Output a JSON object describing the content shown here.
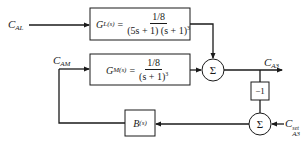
{
  "diagram": {
    "type": "block-diagram",
    "inputs": {
      "load_disturbance": {
        "symbol": "C",
        "subscript": "AL"
      },
      "setpoint": {
        "symbol": "C",
        "subscript": "A3",
        "superscript": "set"
      }
    },
    "signals": {
      "manipulated": {
        "symbol": "C",
        "subscript": "AM"
      },
      "output": {
        "symbol": "C",
        "subscript": "A3"
      }
    },
    "blocks": {
      "load": {
        "name": "G",
        "subscript": "L(s)",
        "equals": "=",
        "numerator": "1/8",
        "denominator": "(5s + 1) (s + 1)",
        "exponent": "3"
      },
      "process": {
        "name": "G",
        "subscript": "M(s)",
        "equals": "=",
        "numerator": "1/8",
        "denominator": "(s + 1)",
        "exponent": "3"
      },
      "gain": {
        "label": "−1"
      },
      "controller": {
        "name": "B",
        "subscript": "(s)"
      }
    },
    "summers": {
      "output_sum": {
        "label": "Σ"
      },
      "error_sum": {
        "label": "Σ"
      }
    },
    "line_color": "#1a1a1a"
  }
}
